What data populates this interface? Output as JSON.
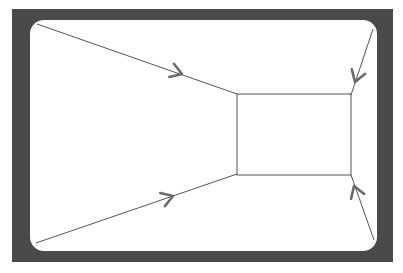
{
  "diagram": {
    "type": "perspective-room-flow",
    "colors": {
      "background": "#ffffff",
      "frame": "#4a4a4a",
      "inner": "#ffffff",
      "lines": "#555555",
      "arrows": "#6a6a6a"
    },
    "frame": {
      "x": 12,
      "y": 9,
      "width": 381,
      "height": 253
    },
    "inner_area": {
      "x": 30,
      "y": 20,
      "width": 347,
      "height": 231,
      "corner_radius": 14
    },
    "back_wall": {
      "x1": 237,
      "y1": 94,
      "x2": 351,
      "y2": 175
    },
    "edges": [
      {
        "name": "top-left-edge",
        "from": [
          37,
          24
        ],
        "to": [
          237,
          94
        ],
        "arrow_tip": [
          182,
          74
        ],
        "arrow_direction": "toward-center"
      },
      {
        "name": "bottom-left-edge",
        "from": [
          36,
          243
        ],
        "to": [
          237,
          174
        ],
        "arrow_tip": [
          173,
          196
        ],
        "arrow_direction": "toward-center"
      },
      {
        "name": "top-right-edge",
        "from": [
          373,
          29
        ],
        "to": [
          351,
          95
        ],
        "arrow_tip": [
          355,
          82
        ],
        "arrow_direction": "toward-center"
      },
      {
        "name": "bottom-right-edge",
        "from": [
          374,
          240
        ],
        "to": [
          351,
          175
        ],
        "arrow_tip": [
          354,
          186
        ],
        "arrow_direction": "toward-center"
      }
    ]
  }
}
